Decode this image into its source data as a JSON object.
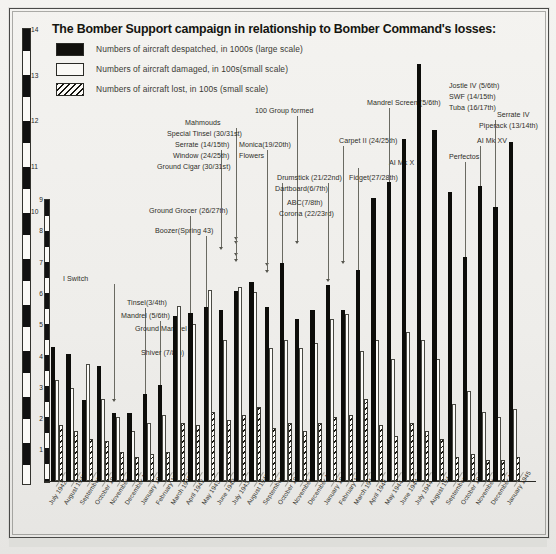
{
  "title": "The Bomber Support campaign in relationship to Bomber Command's losses:",
  "legend": [
    {
      "key": "despatched",
      "label": "Numbers of aircraft despatched, in 1000s (large scale)",
      "swatch": "solid-black"
    },
    {
      "key": "damaged",
      "label": "Numbers of aircraft damaged, in 100s(small scale)",
      "swatch": "open-white"
    },
    {
      "key": "lost",
      "label": "Numbers of aircraft lost, in 100s (small scale)",
      "swatch": "hatched"
    }
  ],
  "axes": {
    "large_scale_ticks": [
      "14",
      "13",
      "12",
      "11",
      "10"
    ],
    "small_scale_ticks": [
      "9",
      "8",
      "7",
      "6",
      "5",
      "4",
      "3",
      "2",
      "1"
    ]
  },
  "chart_data": {
    "type": "bar",
    "title": "The Bomber Support campaign in relationship to Bomber Command's losses:",
    "xlabel": "",
    "ylabel": "",
    "grid": false,
    "legend_position": "top-left",
    "ylim": [
      0,
      14
    ],
    "categories": [
      "July 1942",
      "August 1942",
      "September 1942",
      "October 1942",
      "November 1942",
      "December 1942",
      "January 1943",
      "February 1943",
      "March 1943",
      "April 1943",
      "May 1943",
      "June 1943",
      "July 1943",
      "August 1943",
      "September 1943",
      "October 1943",
      "November 1943",
      "December 1943",
      "January 1944",
      "February 1944",
      "March 1944",
      "April 1944",
      "May 1944",
      "June 1944",
      "July 1944",
      "August 1944",
      "September 1944",
      "October 1944",
      "November 1944",
      "December 1944",
      "January 1945"
    ],
    "series": [
      {
        "name": "Numbers of aircraft despatched, in 1000s (large scale)",
        "values": [
          4.3,
          4.1,
          2.6,
          3.7,
          2.2,
          2.2,
          2.8,
          3.1,
          5.3,
          5.4,
          5.6,
          5.5,
          6.1,
          6.4,
          5.6,
          7.0,
          5.2,
          5.5,
          6.3,
          5.5,
          6.8,
          9.1,
          9.6,
          11.0,
          13.4,
          11.3,
          9.3,
          7.2,
          9.5,
          8.8,
          10.9
        ]
      },
      {
        "name": "Numbers of aircraft damaged, in 100s(small scale)",
        "values": [
          3.8,
          3.5,
          4.4,
          3.1,
          2.4,
          1.9,
          2.2,
          2.5,
          6.6,
          5.9,
          7.2,
          5.3,
          7.3,
          7.1,
          5.0,
          5.3,
          5.0,
          5.2,
          6.1,
          6.3,
          4.9,
          5.3,
          4.6,
          5.6,
          5.3,
          4.6,
          2.9,
          3.4,
          2.6,
          2.4,
          2.7
        ]
      },
      {
        "name": "Numbers of aircraft lost, in 100s (small scale)",
        "values": [
          2.1,
          1.9,
          1.6,
          1.5,
          1.1,
          0.9,
          1.0,
          1.1,
          2.2,
          2.1,
          2.6,
          2.3,
          2.5,
          2.8,
          2.0,
          2.2,
          1.9,
          2.2,
          2.4,
          2.5,
          3.1,
          2.1,
          1.7,
          2.2,
          1.9,
          1.6,
          0.9,
          1.0,
          0.8,
          0.8,
          0.9
        ]
      }
    ],
    "annotations": [
      {
        "text": "I Switch",
        "category": "November 1942"
      },
      {
        "text": "Tinsel(3/4th)",
        "category": "January 1943"
      },
      {
        "text": "Mandrel (5/6th)",
        "category": "February 1943"
      },
      {
        "text": "Ground Mandrel",
        "category": "February 1943"
      },
      {
        "text": "Shiver (7/8th)",
        "category": "March 1943"
      },
      {
        "text": "Ground Grocer (26/27th)",
        "category": "April 1943"
      },
      {
        "text": "Boozer(Spring 43)",
        "category": "April 1943"
      },
      {
        "text": "Mahmouds",
        "category": "July 1943"
      },
      {
        "text": "Special Tinsel (30/31st)",
        "category": "July 1943"
      },
      {
        "text": "Serrate (14/15th)",
        "category": "June 1943"
      },
      {
        "text": "Window (24/25th)",
        "category": "July 1943"
      },
      {
        "text": "Ground Cigar (30/31st)",
        "category": "July 1943"
      },
      {
        "text": "Monica(19/20th)",
        "category": "September 1943"
      },
      {
        "text": "Flowers",
        "category": "September 1943"
      },
      {
        "text": "100 Group formed",
        "category": "November 1943"
      },
      {
        "text": "Drumstick (21/22nd)",
        "category": "October 1943"
      },
      {
        "text": "Dartboard(6/7th)",
        "category": "October 1943"
      },
      {
        "text": "ABC(7/8th)",
        "category": "October 1943"
      },
      {
        "text": "Corona (22/23rd)",
        "category": "October 1943"
      },
      {
        "text": "Carpet II (24/25th)",
        "category": "February 1944"
      },
      {
        "text": "Fidget(27/28th)",
        "category": "January 1944"
      },
      {
        "text": "AI Mk X",
        "category": "March 1944"
      },
      {
        "text": "Mandrel Screen (5/6th)",
        "category": "May 1944"
      },
      {
        "text": "Jostle IV (5/6th)",
        "category": "July 1944"
      },
      {
        "text": "SWF (14/15th)",
        "category": "July 1944"
      },
      {
        "text": "Tuba (16/17th)",
        "category": "July 1944"
      },
      {
        "text": "Serrate IV",
        "category": "December 1944"
      },
      {
        "text": "Piperack (13/14th)",
        "category": "December 1944"
      },
      {
        "text": "AI Mk XV",
        "category": "November 1944"
      },
      {
        "text": "Perfectos",
        "category": "October 1944"
      }
    ]
  }
}
